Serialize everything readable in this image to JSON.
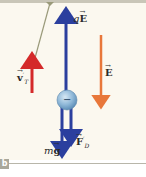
{
  "figure": {
    "panel_label": "b",
    "colors": {
      "background": "#fbf8ef",
      "ceiling": "#c9c6b8",
      "rope": "#9a9a7a",
      "terminal_velocity_arrow": "#d42a2a",
      "electric_force_arrow": "#2b3f9e",
      "field_arrow": "#e8773a",
      "gravity_arrow": "#2b3f9e",
      "drag_arrow": "#2b3f9e",
      "droplet": "#8fb8d8"
    },
    "droplet": {
      "charge_symbol": "−"
    },
    "labels": {
      "terminal_velocity": {
        "symbol": "v",
        "prime_sub": "T",
        "prime": "′"
      },
      "electric_force": {
        "coef": "q",
        "symbol": "E"
      },
      "field": {
        "symbol": "E"
      },
      "gravity": {
        "coef": "m",
        "symbol": "g"
      },
      "drag": {
        "symbol": "F",
        "sub": "D",
        "prime": "′"
      }
    }
  }
}
